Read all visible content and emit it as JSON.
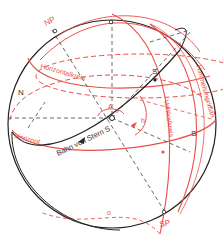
{
  "diagram": {
    "colors": {
      "sphere": "#222222",
      "red": "#e8504a",
      "dashed": "#444444",
      "background": "#ffffff"
    },
    "labels": {
      "np": "NP",
      "sp": "SP",
      "north": "N",
      "south_horizon": "S",
      "star": "S",
      "zenith_marker": "Z",
      "azimuth": "A",
      "altitude": "h",
      "horizontalkreis": "Horizontalkreis",
      "horizont": "Horizont",
      "vertikalkreis": "Vertikalkreis",
      "himmelsmeridian": "Himmelsmeridian",
      "bahn": "Bahn von Stern S",
      "nadir_o": "o"
    }
  }
}
